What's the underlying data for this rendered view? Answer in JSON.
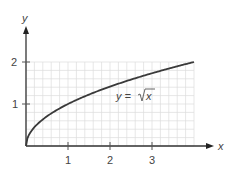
{
  "chart_data": {
    "type": "line",
    "title": "",
    "xlabel": "x",
    "ylabel": "y",
    "xlim": [
      0,
      4
    ],
    "ylim": [
      0,
      2
    ],
    "x_ticks": [
      "1",
      "2",
      "3"
    ],
    "y_ticks": [
      "1",
      "2"
    ],
    "grid": true,
    "grid_minor_step": 0.2,
    "series": [
      {
        "name": "y = √x",
        "function": "sqrt(x)",
        "x": [
          0,
          0.25,
          0.5,
          1,
          1.5,
          2,
          2.5,
          3,
          3.5,
          4
        ],
        "values": [
          0,
          0.5,
          0.707,
          1,
          1.225,
          1.414,
          1.581,
          1.732,
          1.871,
          2
        ]
      }
    ],
    "annotations": [
      {
        "text": "y = √x",
        "x": 2.6,
        "y": 1.2
      }
    ],
    "colors": {
      "curve": "#3a3a3a",
      "grid": "#dcdcdc",
      "axis": "#333333"
    }
  },
  "labels": {
    "x_axis": "x",
    "y_axis": "y",
    "tick_x1": "1",
    "tick_x2": "2",
    "tick_x3": "3",
    "tick_y1": "1",
    "tick_y2": "2",
    "curve_label_prefix": "y =",
    "curve_label_radicand": "x"
  }
}
